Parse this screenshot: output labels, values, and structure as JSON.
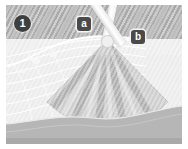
{
  "figure": {
    "panel_number": "1",
    "type": "grayscale-medical-illustration",
    "background_tone_upper": "#a9a9a9",
    "background_tone_lower": "#ececec",
    "bottom_band_tone": "#b6b6b6"
  },
  "badges": {
    "step": {
      "label": "1",
      "name": "step-number-badge",
      "shape": "circle",
      "fill": "#3f3f3f",
      "text_color": "#ffffff"
    },
    "markers": [
      {
        "label": "a",
        "name": "marker-a",
        "shape": "rounded-square",
        "fill": "#4a4a4a",
        "text_color": "#ffffff"
      },
      {
        "label": "b",
        "name": "marker-b",
        "shape": "rounded-square",
        "fill": "#4a4a4a",
        "text_color": "#ffffff"
      }
    ]
  },
  "instruments": [
    {
      "name": "instrument-shaft-a",
      "marker": "a",
      "tone": "#fbfbfb"
    },
    {
      "name": "instrument-shaft-b",
      "marker": "b",
      "tone": "#fbfbfb"
    }
  ],
  "beam": {
    "name": "ultrasound-sector-beam",
    "shape": "fan",
    "apex_x": 101,
    "apex_y": 35,
    "radius": 86,
    "half_angle_deg": 44,
    "stripe_count": 7,
    "tone_light": "#d2d2d2",
    "tone_dark": "#b0b0b0"
  }
}
